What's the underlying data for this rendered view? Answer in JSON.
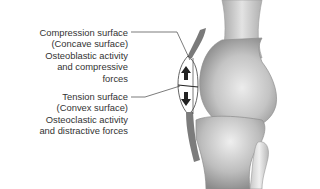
{
  "diagram": {
    "labels": {
      "compression": {
        "lines": [
          "Compression surface",
          "(Concave surface)",
          "Osteoblastic activity",
          "and compressive",
          "forces"
        ]
      },
      "tension": {
        "lines": [
          "Tension surface",
          "(Convex surface)",
          "Osteoclastic activity",
          "and distractive forces"
        ]
      }
    },
    "icons": {
      "upper_arrow": "arrow-up-icon",
      "lower_arrow": "arrow-down-icon"
    },
    "colors": {
      "bone_light": "#e6e6e6",
      "bone_mid": "#b8b8b8",
      "bone_dark": "#8a8a8a",
      "line": "#444444",
      "text": "#333333"
    }
  }
}
